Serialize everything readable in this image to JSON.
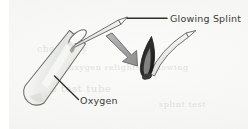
{
  "figure": {
    "kind": "science-diagram",
    "background_color": "#f5f5f3",
    "ink_color": "#4a4a4a",
    "flame_color": "#2b2b2b",
    "flame_core_color": "#8d8d8d",
    "tube_fill_color": "#e6e8e4"
  },
  "labels": {
    "glowing_splint": "Glowing Splint",
    "oxygen": "Oxygen"
  },
  "icons": {
    "test_tube": "test-tube-icon",
    "splint_in_tube": "splint-icon",
    "splint_lit": "lit-splint-icon",
    "flame": "flame-icon",
    "motion_arrow": "arrow-down-right-icon",
    "leader_glowing_splint": "leader-line-icon",
    "leader_oxygen": "leader-line-icon"
  },
  "bleed_through": {
    "line1": "chemistry",
    "line2": "oxygen relights a glowing",
    "line3": "the test tube",
    "line4": "splint test"
  }
}
